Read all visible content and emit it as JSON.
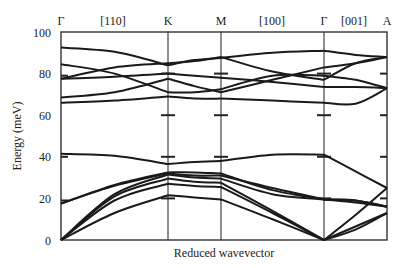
{
  "chart_data": {
    "type": "line",
    "title": "",
    "xlabel": "Reduced wavevector",
    "ylabel": "Energy (meV)",
    "ylim": [
      0,
      100
    ],
    "yticks": [
      0,
      20,
      40,
      60,
      80,
      100
    ],
    "grid": false,
    "legend": null,
    "high_symmetry_points": [
      "Γ",
      "K",
      "M",
      "Γ",
      "A"
    ],
    "direction_labels": [
      "[110]",
      "[100]",
      "[001]"
    ],
    "segments": [
      {
        "from": "Γ",
        "to": "K",
        "direction": "[110]",
        "x0": 0.0,
        "x1": 1.0
      },
      {
        "from": "K",
        "to": "M",
        "direction": "",
        "x0": 1.0,
        "x1": 1.5
      },
      {
        "from": "M",
        "to": "Γ",
        "direction": "[100]",
        "x0": 1.5,
        "x1": 2.5
      },
      {
        "from": "Γ",
        "to": "A",
        "direction": "[001]",
        "x0": 2.5,
        "x1": 3.1
      }
    ],
    "x_positions": {
      "Γ1": 0.0,
      "K": 1.0,
      "M": 1.5,
      "Γ2": 2.5,
      "A": 3.1
    },
    "series": [
      {
        "name": "branch-1 (acoustic)",
        "x": [
          0,
          0.5,
          1.0,
          1.25,
          1.5,
          2.0,
          2.5,
          2.8,
          3.1
        ],
        "values": [
          0,
          13,
          21.5,
          20.5,
          19.5,
          10,
          0,
          6.5,
          13
        ]
      },
      {
        "name": "branch-2 (acoustic)",
        "x": [
          0,
          0.5,
          1.0,
          1.25,
          1.5,
          2.0,
          2.5,
          2.8,
          3.1
        ],
        "values": [
          0,
          19,
          27,
          26,
          25.5,
          13,
          0,
          5,
          13
        ]
      },
      {
        "name": "branch-3 (acoustic)",
        "x": [
          0,
          0.5,
          1.0,
          1.25,
          1.5,
          2.0,
          2.5,
          2.8,
          3.1
        ],
        "values": [
          0,
          21,
          29.5,
          28,
          27.5,
          14,
          0,
          12,
          25
        ]
      },
      {
        "name": "branch-4",
        "x": [
          0,
          0.5,
          1.0,
          1.25,
          1.5,
          2.0,
          2.5,
          2.8,
          3.1
        ],
        "values": [
          0,
          22,
          31.5,
          30,
          29.5,
          22,
          19.5,
          18,
          16
        ]
      },
      {
        "name": "branch-5",
        "x": [
          0,
          0.5,
          1.0,
          1.25,
          1.5,
          2.0,
          2.5,
          2.8,
          3.1
        ],
        "values": [
          17.5,
          26,
          32,
          31,
          31,
          25,
          19.5,
          19,
          16
        ]
      },
      {
        "name": "branch-6",
        "x": [
          0,
          0.5,
          1.0,
          1.25,
          1.5,
          2.0,
          2.5,
          2.8,
          3.1
        ],
        "values": [
          17.5,
          26.5,
          32.5,
          32.5,
          32,
          24,
          19.5,
          19,
          16
        ]
      },
      {
        "name": "branch-7",
        "x": [
          0,
          0.5,
          1.0,
          1.25,
          1.5,
          2.0,
          2.5,
          2.8,
          3.1
        ],
        "values": [
          41.5,
          40.5,
          36.5,
          37.5,
          38,
          41,
          41,
          33,
          25
        ]
      },
      {
        "name": "branch-8",
        "x": [
          0,
          0.5,
          1.0,
          1.25,
          1.5,
          2.0,
          2.5,
          2.8,
          3.1
        ],
        "values": [
          66,
          67,
          69,
          68,
          68,
          67,
          66,
          65.5,
          73
        ]
      },
      {
        "name": "branch-9",
        "x": [
          0,
          0.5,
          1.0,
          1.25,
          1.5,
          2.0,
          2.5,
          2.8,
          3.1
        ],
        "values": [
          68.5,
          71,
          77.5,
          74,
          71,
          77,
          83,
          85,
          88
        ]
      },
      {
        "name": "branch-10",
        "x": [
          0,
          0.5,
          1.0,
          1.25,
          1.5,
          2.0,
          2.5,
          2.8,
          3.1
        ],
        "values": [
          77.5,
          78.5,
          80,
          79,
          78,
          76,
          73.5,
          73.5,
          73
        ]
      },
      {
        "name": "branch-11",
        "x": [
          0,
          0.5,
          1.0,
          1.25,
          1.5,
          2.0,
          2.5,
          2.8,
          3.1
        ],
        "values": [
          84.5,
          80,
          71,
          71,
          72.5,
          79,
          79,
          77,
          73
        ]
      },
      {
        "name": "branch-12",
        "x": [
          0,
          0.5,
          1.0,
          1.25,
          1.5,
          2.0,
          2.5,
          2.8,
          3.1
        ],
        "values": [
          77.5,
          83,
          85,
          86,
          88,
          81,
          77,
          85,
          88
        ]
      },
      {
        "name": "branch-13",
        "x": [
          0,
          0.5,
          1.0,
          1.25,
          1.5,
          2.0,
          2.5,
          2.8,
          3.1
        ],
        "values": [
          92.5,
          90.5,
          84,
          86.5,
          87.5,
          90,
          91,
          89,
          88
        ]
      }
    ],
    "experimental_markers": [
      {
        "x_label": "Γ",
        "energies": [
          19,
          40,
          79
        ]
      },
      {
        "x_label": "K",
        "energies": [
          20,
          40,
          60,
          80
        ]
      },
      {
        "x_label": "M",
        "energies": [
          40,
          60,
          80
        ]
      },
      {
        "x_label": "Γ2",
        "energies": [
          20,
          40,
          60,
          80
        ]
      },
      {
        "x_label": "A",
        "energies": [
          20,
          40,
          60,
          80
        ]
      }
    ]
  },
  "axis": {
    "y_tick_labels": [
      "0",
      "20",
      "40",
      "60",
      "80",
      "100"
    ],
    "ylabel": "Energy (meV)",
    "xlabel": "Reduced wavevector",
    "top_labels": [
      {
        "text": "Γ",
        "x": 61
      },
      {
        "text": "[110]",
        "x": 113
      },
      {
        "text": "K",
        "x": 168
      },
      {
        "text": "M",
        "x": 221
      },
      {
        "text": "[100]",
        "x": 272
      },
      {
        "text": "Γ",
        "x": 324
      },
      {
        "text": "[001]",
        "x": 354
      },
      {
        "text": "A",
        "x": 387
      }
    ]
  }
}
